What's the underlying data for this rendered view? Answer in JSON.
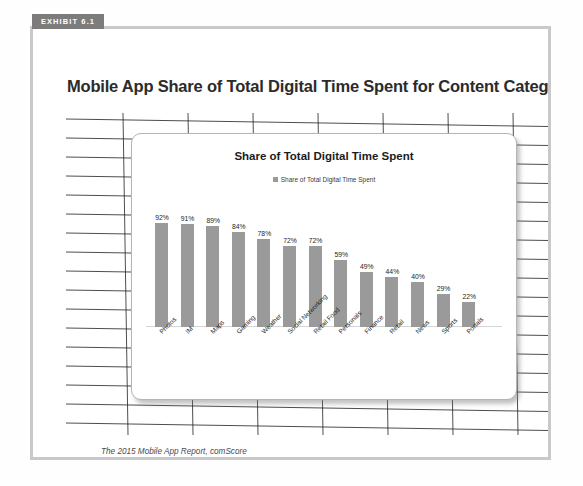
{
  "exhibit": {
    "tab_label": "EXHIBIT 6.1",
    "title": "Mobile App Share of Total Digital Time Spent for Content Categories",
    "border_color": "#c9c9c9",
    "tab_color": "#7c7c7c"
  },
  "source": {
    "line1": "The 2015 Mobile App Report, comScore",
    "line2": "https://www.comscore.com/Insights/Presentations-and-Whitepapers/2015/The-2015-US-Mobile-App-Report"
  },
  "chart_data": {
    "type": "bar",
    "title": "Share of Total Digital Time Spent",
    "xlabel": "",
    "ylabel": "",
    "ylim": [
      0,
      100
    ],
    "grid": false,
    "legend_position": "top-center",
    "legend": [
      "Share of Total Digital Time Spent"
    ],
    "series_name": "Share of Total Digital Time Spent",
    "bar_color": "#9a9a9a",
    "categories": [
      "Photos",
      "IM",
      "Maps",
      "Gaming",
      "Weather",
      "Social Networking",
      "Retail Food",
      "Personals",
      "Finance",
      "Retail",
      "News",
      "Sports",
      "Portals"
    ],
    "values": [
      92,
      91,
      89,
      84,
      78,
      72,
      72,
      59,
      49,
      44,
      40,
      29,
      22
    ],
    "data_labels": [
      "92%",
      "91%",
      "89%",
      "84%",
      "78%",
      "72%",
      "72%",
      "59%",
      "49%",
      "44%",
      "40%",
      "29%",
      "22%"
    ]
  }
}
